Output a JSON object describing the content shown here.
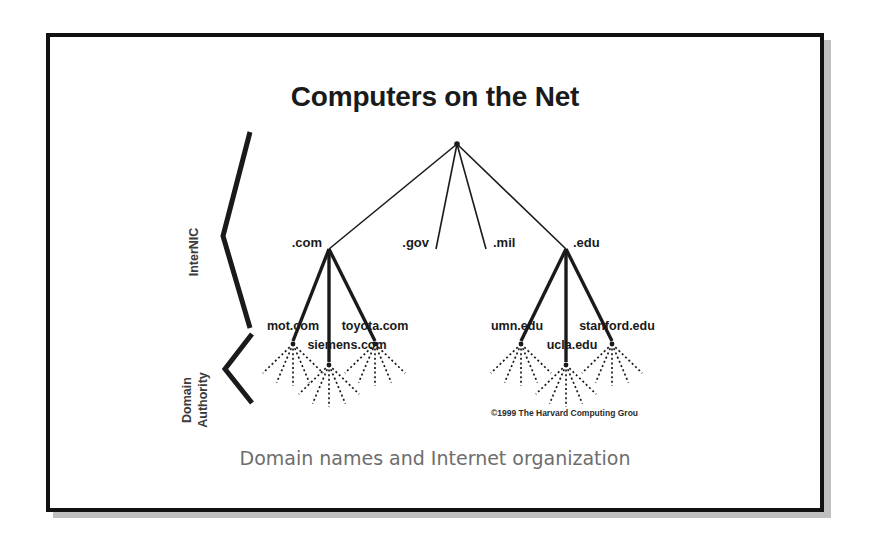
{
  "slide": {
    "title": "Computers on the Net",
    "caption": "Domain names and Internet organization",
    "copyright": "©1999 The Harvard Computing Grou",
    "background_color": "#ffffff",
    "frame_color": "#111111",
    "shadow_color": "#bfbfbf",
    "ink_color": "#1a1a1a"
  },
  "side_labels": {
    "internic": "InterNIC",
    "domain_line1": "Domain",
    "domain_line2": "Authority"
  },
  "tree": {
    "root": {
      "name": "root-node",
      "x": 453,
      "y": 140
    },
    "tlds": [
      {
        "id": "com",
        "label": ".com",
        "x": 325,
        "y": 245,
        "label_x": 318,
        "label_y": 243,
        "anchor": "end"
      },
      {
        "id": "gov",
        "label": ".gov",
        "x": 432,
        "y": 245,
        "label_x": 425,
        "label_y": 243,
        "anchor": "end"
      },
      {
        "id": "mil",
        "label": ".mil",
        "x": 482,
        "y": 245,
        "label_x": 489,
        "label_y": 243,
        "anchor": "start"
      },
      {
        "id": "edu",
        "label": ".edu",
        "x": 562,
        "y": 245,
        "label_x": 569,
        "label_y": 243,
        "anchor": "start"
      }
    ],
    "hosts": [
      {
        "id": "mot-com",
        "label": "mot.com",
        "parent": "com",
        "x": 289,
        "y": 337,
        "label_x": 289,
        "label_y": 326,
        "anchor": "middle"
      },
      {
        "id": "siemens-com",
        "label": "siemens.com",
        "parent": "com",
        "x": 325,
        "y": 358,
        "label_x": 343,
        "label_y": 345,
        "anchor": "middle"
      },
      {
        "id": "toyota-com",
        "label": "toyota.com",
        "parent": "com",
        "x": 371,
        "y": 337,
        "label_x": 371,
        "label_y": 326,
        "anchor": "middle"
      },
      {
        "id": "umn-edu",
        "label": "umn.edu",
        "parent": "edu",
        "x": 517,
        "y": 337,
        "label_x": 513,
        "label_y": 326,
        "anchor": "middle"
      },
      {
        "id": "ucla-edu",
        "label": "ucla.edu",
        "parent": "edu",
        "x": 562,
        "y": 358,
        "label_x": 568,
        "label_y": 345,
        "anchor": "middle"
      },
      {
        "id": "stanford-edu",
        "label": "stanford.edu",
        "parent": "edu",
        "x": 608,
        "y": 337,
        "label_x": 613,
        "label_y": 326,
        "anchor": "middle"
      }
    ],
    "leaf_fans": [
      {
        "id": "fan-mot-com",
        "x": 289,
        "y": 340,
        "count": 5,
        "length": 42,
        "spread": 46
      },
      {
        "id": "fan-siemens-com",
        "x": 325,
        "y": 361,
        "count": 5,
        "length": 42,
        "spread": 46
      },
      {
        "id": "fan-toyota-com",
        "x": 371,
        "y": 340,
        "count": 5,
        "length": 42,
        "spread": 46
      },
      {
        "id": "fan-umn-edu",
        "x": 517,
        "y": 340,
        "count": 5,
        "length": 42,
        "spread": 46
      },
      {
        "id": "fan-ucla-edu",
        "x": 562,
        "y": 361,
        "count": 5,
        "length": 42,
        "spread": 46
      },
      {
        "id": "fan-stanford-edu",
        "x": 608,
        "y": 340,
        "count": 5,
        "length": 42,
        "spread": 46
      }
    ]
  },
  "braces": {
    "internic": {
      "top_x": 246,
      "top_y": 128,
      "apex_x": 219,
      "apex_y": 232,
      "bottom_x": 246,
      "bottom_y": 324
    },
    "domain_authority": {
      "top_x": 248,
      "top_y": 330,
      "apex_x": 221,
      "apex_y": 365,
      "bottom_x": 248,
      "bottom_y": 399
    }
  }
}
